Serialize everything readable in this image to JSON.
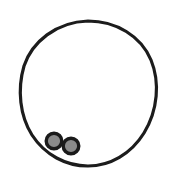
{
  "document": {
    "title": "Line Drawing",
    "width": 174,
    "height": 174,
    "background_color": "#ffffff",
    "description": "Simple black line-art drawing of a large open circle with two small shaded circles resting on the lower-left inside of its rim"
  },
  "palette": {
    "background": "#ffffff",
    "stroke_black": "#1c1c1c",
    "ring_outline": "#141414",
    "small_circle_fill": "#8a8a8a",
    "small_circle_outline": "#1a1a1a"
  },
  "shapes": {
    "main_ring": {
      "name": "large-circle",
      "type": "circle-outline",
      "center_x": 88,
      "center_y": 93,
      "radius_x": 67,
      "radius_y": 72,
      "stroke_width": 3.2,
      "stroke_color": "#1c1c1c",
      "fill": "none"
    },
    "small_circles": [
      {
        "name": "small-circle-left",
        "center_x": 54,
        "center_y": 141,
        "radius": 9.5,
        "fill": "#8a8a8a",
        "stroke_color": "#1a1a1a",
        "stroke_width": 3.4
      },
      {
        "name": "small-circle-right",
        "center_x": 71,
        "center_y": 146,
        "radius": 9.5,
        "fill": "#8a8a8a",
        "stroke_color": "#1a1a1a",
        "stroke_width": 3.4
      }
    ]
  }
}
